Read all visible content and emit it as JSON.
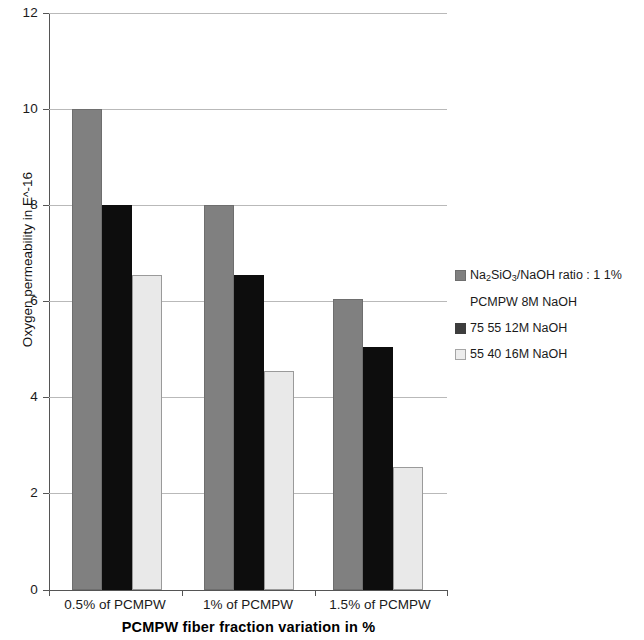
{
  "chart_data": {
    "type": "bar",
    "title": "",
    "xlabel": "PCMPW fiber fraction variation in %",
    "ylabel": "Oxygen permeability in E^-16",
    "ylabel_parts": {
      "prefix": "Oxygen permeability in E",
      "caret": "^",
      "suffix": "-16"
    },
    "categories": [
      "0.5% of PCMPW",
      "1% of PCMPW",
      "1.5% of PCMPW"
    ],
    "ylim": [
      0,
      12
    ],
    "yticks": [
      0,
      2,
      4,
      6,
      8,
      10,
      12
    ],
    "ytick_labels": [
      "0",
      "2",
      "4",
      "6",
      "8",
      "10",
      "12"
    ],
    "grid": "horizontal",
    "legend_position": "right",
    "series": [
      {
        "name": "Na2SiO3/NaOH ratio : 1 1% PCMPW 8M NaOH",
        "color": "#808080",
        "values": [
          10.0,
          8.0,
          6.05
        ]
      },
      {
        "name": "75 55  12M NaOH",
        "color": "#0d0d0d",
        "values": [
          8.0,
          6.55,
          5.05
        ]
      },
      {
        "name": "55 40  16M NaOH",
        "color": "#e9e9e9",
        "values": [
          6.55,
          4.55,
          2.55
        ]
      }
    ]
  },
  "legend": {
    "entries": [
      {
        "swatch": "series0",
        "line1_a": "Na",
        "line1_sub1": "2",
        "line1_b": "SiO",
        "line1_sub2": "3",
        "line1_c": "/NaOH ratio : 1 1%",
        "line2": "PCMPW 8M NaOH"
      },
      {
        "swatch": "series1",
        "line1_c": "75 55  12M NaOH",
        "line2": ""
      },
      {
        "swatch": "series2",
        "line1_c": "55 40  16M NaOH",
        "line2": ""
      }
    ]
  }
}
